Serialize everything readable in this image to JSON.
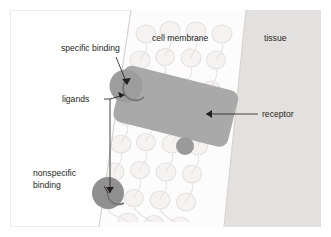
{
  "figure": {
    "background_color": "#ffffff",
    "frame_color": "#eceaea",
    "width": 331,
    "height": 237
  },
  "regions": {
    "extracellular": {
      "name": "extracellular space",
      "label": "",
      "color": "#ffffff"
    },
    "membrane": {
      "label": "cell membrane",
      "fill_color": "#fbfbfb",
      "outline_color": "#d8d6d4",
      "lipid_color": "#eceae8"
    },
    "tissue": {
      "label": "tissue",
      "fill_color": "#e2e0de"
    }
  },
  "labels": {
    "specific_binding": "specific binding",
    "ligands": "ligands",
    "nonspecific_binding_line1": "nonspecific",
    "nonspecific_binding_line2": "binding",
    "receptor": "receptor",
    "cell_membrane": "cell membrane",
    "tissue": "tissue"
  },
  "objects": {
    "receptor": {
      "name": "receptor",
      "color": "#a8a8a8",
      "shape": "rounded-rectangle"
    },
    "ligand_specific": {
      "name": "ligand bound to receptor",
      "color": "#9e9e9e",
      "shape": "circle"
    },
    "ligand_nonspecific": {
      "name": "ligand bound nonspecifically",
      "color": "#8f8f8f",
      "shape": "circle"
    },
    "ligand_free": {
      "name": "free ligand in membrane",
      "color": "#9a9a9a",
      "shape": "circle"
    }
  },
  "leader_lines": {
    "color": "#231f20",
    "items": [
      {
        "name": "specific-binding-leader",
        "from": "specific binding",
        "to": "ligand_specific"
      },
      {
        "name": "ligands-leader",
        "from": "ligands",
        "to": "ligand_specific and ligand_nonspecific"
      },
      {
        "name": "nonspecific-binding-leader",
        "from": "nonspecific binding",
        "to": "ligand_nonspecific"
      },
      {
        "name": "receptor-leader",
        "from": "receptor",
        "to": "receptor"
      }
    ]
  }
}
